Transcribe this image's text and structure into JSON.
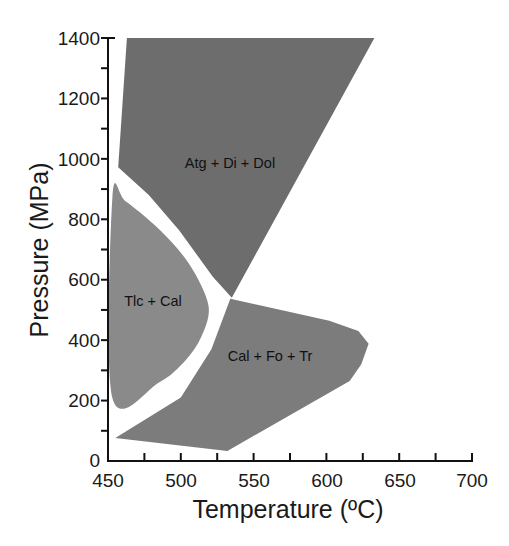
{
  "chart_data": {
    "type": "area",
    "title": "",
    "xlabel": "Temperature (ºC)",
    "ylabel": "Pressure (MPa)",
    "xlim": [
      450,
      700
    ],
    "ylim": [
      0,
      1400
    ],
    "x_ticks": [
      450,
      500,
      550,
      600,
      650,
      700
    ],
    "x_minor_step": 25,
    "y_ticks": [
      0,
      200,
      400,
      600,
      800,
      1000,
      1200,
      1400
    ],
    "y_minor_step": 100,
    "grid": false,
    "legend": null,
    "regions": [
      {
        "name": "Atg + Di + Dol",
        "color": "#6d6d6d",
        "label_pos": [
          530,
          1000
        ],
        "points": [
          [
            463,
            1400
          ],
          [
            633,
            1400
          ],
          [
            535,
            540
          ],
          [
            522,
            610
          ],
          [
            499,
            763
          ],
          [
            478,
            880
          ],
          [
            457,
            972
          ]
        ]
      },
      {
        "name": "Tlc + Cal",
        "color": "#8a8a8a",
        "label_pos": [
          475,
          540
        ],
        "points": [
          [
            453,
            873
          ],
          [
            462,
            860
          ],
          [
            486,
            763
          ],
          [
            506,
            650
          ],
          [
            519,
            514
          ],
          [
            514,
            410
          ],
          [
            503,
            332
          ],
          [
            485,
            260
          ],
          [
            453,
            209
          ]
        ]
      },
      {
        "name": "Cal + Fo + Tr",
        "color": "#7c7c7c",
        "label_pos": [
          570,
          340
        ],
        "points": [
          [
            534,
            537
          ],
          [
            602,
            464
          ],
          [
            622,
            430
          ],
          [
            629,
            388
          ],
          [
            624,
            320
          ],
          [
            616,
            265
          ],
          [
            532,
            33
          ],
          [
            455,
            76
          ],
          [
            500,
            210
          ],
          [
            521,
            370
          ]
        ]
      }
    ]
  },
  "axes": {
    "x_title": "Temperature (ºC)",
    "y_title": "Pressure (MPa)",
    "x_tick_labels": [
      "450",
      "500",
      "550",
      "600",
      "650",
      "700"
    ],
    "y_tick_labels": [
      "0",
      "200",
      "400",
      "600",
      "800",
      "1000",
      "1200",
      "1400"
    ]
  },
  "labels": {
    "atg": "Atg + Di + Dol",
    "tlc": "Tlc + Cal",
    "cal": "Cal + Fo + Tr"
  }
}
